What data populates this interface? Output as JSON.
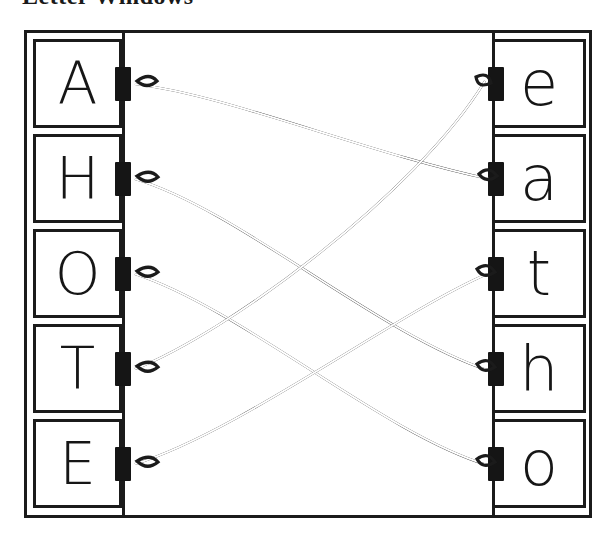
{
  "title": "Letter Windows",
  "frame": {
    "left_column_label": "uppercase-letters",
    "right_column_label": "lowercase-letters"
  },
  "left_cards": [
    {
      "letter": "A",
      "name": "card-uppercase-a"
    },
    {
      "letter": "H",
      "name": "card-uppercase-h"
    },
    {
      "letter": "O",
      "name": "card-uppercase-o"
    },
    {
      "letter": "T",
      "name": "card-uppercase-t"
    },
    {
      "letter": "E",
      "name": "card-uppercase-e"
    }
  ],
  "right_cards": [
    {
      "letter": "e",
      "name": "card-lowercase-e"
    },
    {
      "letter": "a",
      "name": "card-lowercase-a"
    },
    {
      "letter": "t",
      "name": "card-lowercase-t"
    },
    {
      "letter": "h",
      "name": "card-lowercase-h"
    },
    {
      "letter": "o",
      "name": "card-lowercase-o"
    }
  ],
  "connections": [
    {
      "from": "A",
      "to": "a"
    },
    {
      "from": "H",
      "to": "h"
    },
    {
      "from": "O",
      "to": "o"
    },
    {
      "from": "T",
      "to": "e"
    },
    {
      "from": "E",
      "to": "t"
    }
  ],
  "colors": {
    "ink": "#1b1b1b",
    "paper": "#ffffff",
    "tab": "#151515"
  }
}
